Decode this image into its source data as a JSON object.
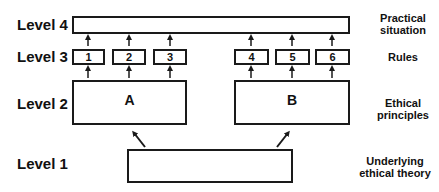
{
  "levels": [
    {
      "label": "Level 4",
      "description": "Practical situation",
      "description_lines": [
        "Practical",
        "situation"
      ]
    },
    {
      "label": "Level 3",
      "description": "Rules",
      "description_lines": [
        "Rules"
      ]
    },
    {
      "label": "Level 2",
      "description": "Ethical principles",
      "description_lines": [
        "Ethical",
        "principles"
      ]
    },
    {
      "label": "Level 1",
      "description": "Underlying ethical theory",
      "description_lines": [
        "Underlying",
        "ethical theory"
      ]
    }
  ],
  "rules": [
    "1",
    "2",
    "3",
    "4",
    "5",
    "6"
  ],
  "principles": [
    "A",
    "B"
  ],
  "colors": {
    "stroke": "#1a1a1a",
    "background": "#ffffff"
  }
}
